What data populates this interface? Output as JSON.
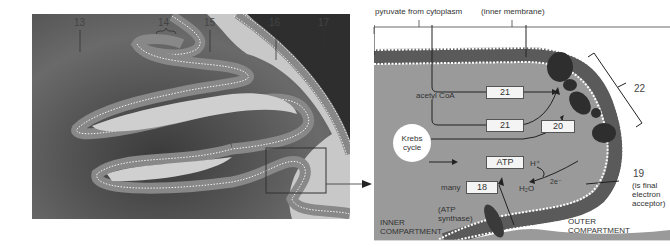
{
  "left_panel": {
    "description": "micrograph of mitochondrion cristae",
    "labels": [
      {
        "id": "13",
        "text": "13"
      },
      {
        "id": "14",
        "text": "14"
      },
      {
        "id": "15",
        "text": "15"
      },
      {
        "id": "16",
        "text": "16"
      },
      {
        "id": "17",
        "text": "17"
      }
    ]
  },
  "right_panel": {
    "top_labels": {
      "pyruvate": "pyruvate from cytoplasm",
      "inner_membrane": "(inner membrane)"
    },
    "acetyl_coa": "acetyl CoA",
    "krebs": {
      "line1": "Krebs",
      "line2": "cycle"
    },
    "boxes": {
      "box_21_top": "21",
      "box_21_bottom": "21",
      "box_atp": "ATP",
      "box_20": "20",
      "box_18": "18"
    },
    "many": "many",
    "atp_synthase": {
      "line1": "(ATP",
      "line2": "synthase)"
    },
    "h_plus": "H⁺",
    "two_e": "2e⁻",
    "h2o": "H₂O",
    "label_22": "22",
    "label_19": "19",
    "final_acceptor": {
      "line1": "(is final",
      "line2": "electron",
      "line3": "acceptor)"
    },
    "inner_compartment": {
      "line1": "INNER",
      "line2": "COMPARTMENT"
    },
    "outer_compartment": {
      "line1": "OUTER",
      "line2": "COMPARTMENT"
    }
  },
  "colors": {
    "matrix_gray": "#9a9a9a",
    "membrane_dark": "#5a5a5a",
    "protein_dark": "#2e2e2e",
    "background": "#ffffff"
  }
}
